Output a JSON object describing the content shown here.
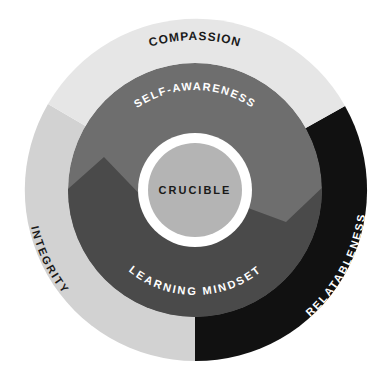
{
  "diagram": {
    "center": {
      "x": 195,
      "y": 190
    },
    "outer_ring": {
      "radius": 171,
      "segments": [
        {
          "id": "compassion",
          "label": "COMPASSION",
          "color": "#e6e6e6",
          "text_color": "#1a1a1a"
        },
        {
          "id": "integrity",
          "label": "INTEGRITY",
          "color": "#d2d2d2",
          "text_color": "#1a1a1a"
        },
        {
          "id": "relatableness",
          "label": "RELATABLENESS",
          "color": "#111111",
          "text_color": "#ffffff"
        }
      ]
    },
    "middle_ring": {
      "radius": 127,
      "segments": [
        {
          "id": "self-awareness",
          "label": "SELF-AWARENESS",
          "color": "#6e6e6e",
          "text_color": "#ffffff"
        },
        {
          "id": "learning-mindset",
          "label": "LEARNING MINDSET",
          "color": "#4a4a4a",
          "text_color": "#ffffff"
        }
      ]
    },
    "core": {
      "label": "CRUCIBLE",
      "ring_color": "#ffffff",
      "ring_radius": 57,
      "fill_color": "#b4b4b4",
      "fill_radius": 47,
      "text_color": "#1a1a1a"
    }
  }
}
